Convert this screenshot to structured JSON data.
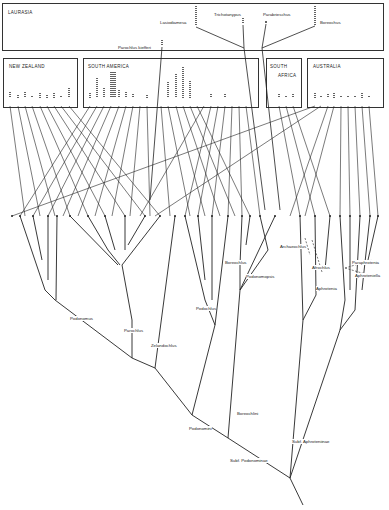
{
  "regions": {
    "laurasia": {
      "label": "LAURASIA"
    },
    "new_zealand": {
      "label": "NEW ZEALAND",
      "columns": [
        4,
        2,
        4,
        1,
        3,
        2,
        3,
        1,
        5
      ]
    },
    "south_america": {
      "label": "SOUTH AMERICA",
      "columns": [
        3,
        10,
        4,
        12,
        5,
        4,
        2,
        1,
        2,
        0,
        1,
        7,
        12,
        16,
        8,
        1,
        1,
        2,
        1,
        2,
        1,
        1
      ]
    },
    "south_africa": {
      "label_line1": "SOUTH",
      "label_line2": "AFRICA",
      "columns": [
        2,
        1,
        2
      ]
    },
    "australia": {
      "label": "AUSTRALIA",
      "columns": [
        3,
        1,
        2,
        3,
        1,
        1,
        1,
        3,
        1
      ]
    }
  },
  "laurasia_taxa": [
    {
      "name": "Lasiodiamesa"
    },
    {
      "name": "Trichotanypus"
    },
    {
      "name": "Parabrieschus"
    },
    {
      "name": "Boreochus"
    },
    {
      "name": "Parochlus kiefferi"
    }
  ],
  "genus_labels": [
    {
      "name": "Podonomus"
    },
    {
      "name": "Parochlus"
    },
    {
      "name": "Zelandochlus"
    },
    {
      "name": "Podochlus"
    },
    {
      "name": "Boreochlus"
    },
    {
      "name": "Podonomopsis"
    },
    {
      "name": "Archaeochlus"
    },
    {
      "name": "Afrochlus"
    },
    {
      "name": "Paraphrotenia"
    },
    {
      "name": "Aphroteniella"
    },
    {
      "name": "Aphrotenia"
    }
  ],
  "higher_taxa": {
    "podonomini": "Podonomini",
    "boreochlini": "Boreochlini",
    "subf_podonominae": "Subf. Podonominae",
    "subf_aphroteniinae": "Subf. Aphroteniinae"
  }
}
